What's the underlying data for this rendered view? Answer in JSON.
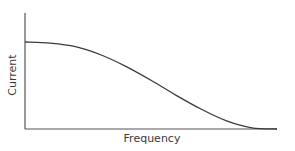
{
  "chart_data": {
    "type": "line",
    "title": "",
    "xlabel": "Frequency",
    "ylabel": "Current",
    "grid": false,
    "legend": null,
    "ticks": {
      "x": [],
      "y": []
    },
    "series": [
      {
        "name": "Current vs Frequency",
        "description": "Flat plateau at low frequency, then smooth sigmoidal roll-off to zero at high frequency",
        "x": [
          0,
          0.1,
          0.2,
          0.3,
          0.4,
          0.5,
          0.6,
          0.7,
          0.8,
          0.9,
          1.0
        ],
        "y": [
          0.75,
          0.74,
          0.71,
          0.64,
          0.54,
          0.42,
          0.29,
          0.17,
          0.07,
          0.01,
          0.0
        ]
      }
    ],
    "xlim": [
      0,
      1
    ],
    "ylim": [
      0,
      1
    ],
    "line_color": "#3a3a3a",
    "axis_color": "#555555"
  }
}
